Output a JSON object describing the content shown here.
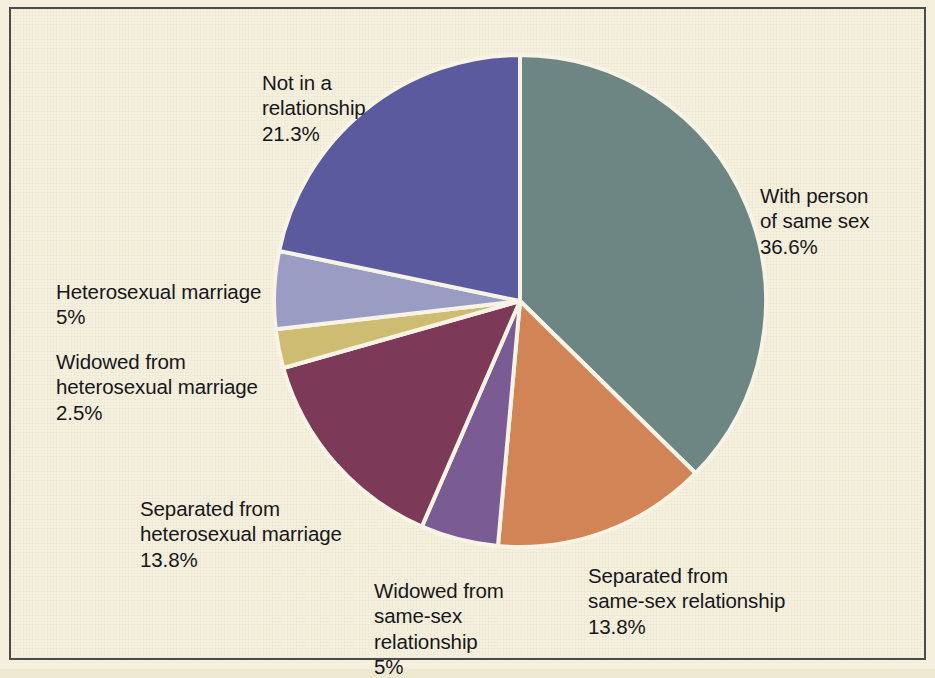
{
  "figure": {
    "background_color": "#f4f0dd",
    "frame_color": "#4c4c4c"
  },
  "chart_data": {
    "type": "pie",
    "title": "",
    "start_angle_deg": 0,
    "direction": "clockwise",
    "radius_px": 246,
    "center": {
      "x": 520,
      "y": 301
    },
    "legend": "none (direct labels)",
    "categories": [
      "With person of same sex",
      "Separated from same-sex relationship",
      "Widowed from same-sex relationship",
      "Separated from heterosexual marriage",
      "Widowed from heterosexual marriage",
      "Heterosexual marriage",
      "Not in a relationship"
    ],
    "values": [
      36.6,
      13.8,
      5,
      13.8,
      2.5,
      5,
      21.3
    ],
    "value_labels": [
      "36.6%",
      "13.8%",
      "5%",
      "13.8%",
      "2.5%",
      "5%",
      "21.3%"
    ],
    "colors": [
      "#6d8683",
      "#d18556",
      "#7a5b93",
      "#7d3a58",
      "#cdbc72",
      "#9a9cc4",
      "#5b5a9e"
    ],
    "slice_separator_color": "#f7f4e6",
    "slices": [
      {
        "label": "With person of same sex",
        "label_text": "With person\nof same sex",
        "percent_label": "36.6%",
        "value": 36.6,
        "color": "#6d8683"
      },
      {
        "label": "Separated from same-sex relationship",
        "label_text": "Separated from\nsame-sex relationship",
        "percent_label": "13.8%",
        "value": 13.8,
        "color": "#d18556"
      },
      {
        "label": "Widowed from same-sex relationship",
        "label_text": "Widowed from\nsame-sex\nrelationship",
        "percent_label": "5%",
        "value": 5,
        "color": "#7a5b93"
      },
      {
        "label": "Separated from heterosexual marriage",
        "label_text": "Separated from\nheterosexual marriage",
        "percent_label": "13.8%",
        "value": 13.8,
        "color": "#7d3a58"
      },
      {
        "label": "Widowed from heterosexual marriage",
        "label_text": "Widowed from\nheterosexual marriage",
        "percent_label": "2.5%",
        "value": 2.5,
        "color": "#cdbc72"
      },
      {
        "label": "Heterosexual marriage",
        "label_text": "Heterosexual marriage",
        "percent_label": "5%",
        "value": 5,
        "color": "#9a9cc4"
      },
      {
        "label": "Not in a relationship",
        "label_text": "Not in a\nrelationship",
        "percent_label": "21.3%",
        "value": 21.3,
        "color": "#5b5a9e"
      }
    ]
  }
}
